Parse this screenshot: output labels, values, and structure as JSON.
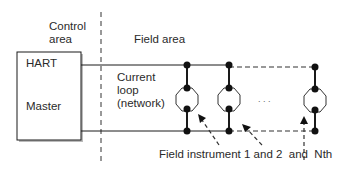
{
  "labels": {
    "control_area_line1": "Control",
    "control_area_line2": "area",
    "field_area": "Field area",
    "master_line1": "HART",
    "master_line2": "Master",
    "loop_line1": "Current",
    "loop_line2": "loop",
    "loop_line3": "(network)",
    "ellipsis": ". . .",
    "instrument_caption": "Field instrument 1 and 2  and  Nth"
  },
  "colors": {
    "line": "#1a1a1a",
    "dash": "#444444"
  }
}
